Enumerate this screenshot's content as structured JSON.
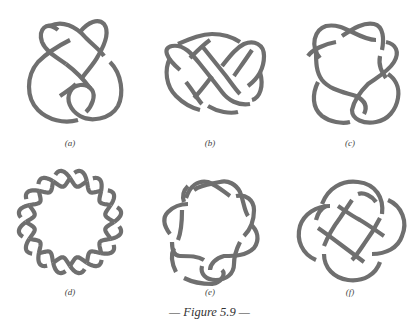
{
  "figure": {
    "caption": "— Figure 5.9 —",
    "stroke_color": "#6f6f6f",
    "background_color": "#ffffff",
    "panels": [
      {
        "id": "a",
        "label": "(a)",
        "description": "knot diagram with two overlapping lobes at top and a looped bottom"
      },
      {
        "id": "b",
        "label": "(b)",
        "description": "horizontal pretzel-like knot with two side lobes"
      },
      {
        "id": "c",
        "label": "(c)",
        "description": "star-shaped knot with bottom loop"
      },
      {
        "id": "d",
        "label": "(d)",
        "description": "circular braided knot with eight crossings around a ring"
      },
      {
        "id": "e",
        "label": "(e)",
        "description": "circular braided knot with bottom loop"
      },
      {
        "id": "f",
        "label": "(f)",
        "description": "four-lobed interlaced knot"
      }
    ]
  }
}
